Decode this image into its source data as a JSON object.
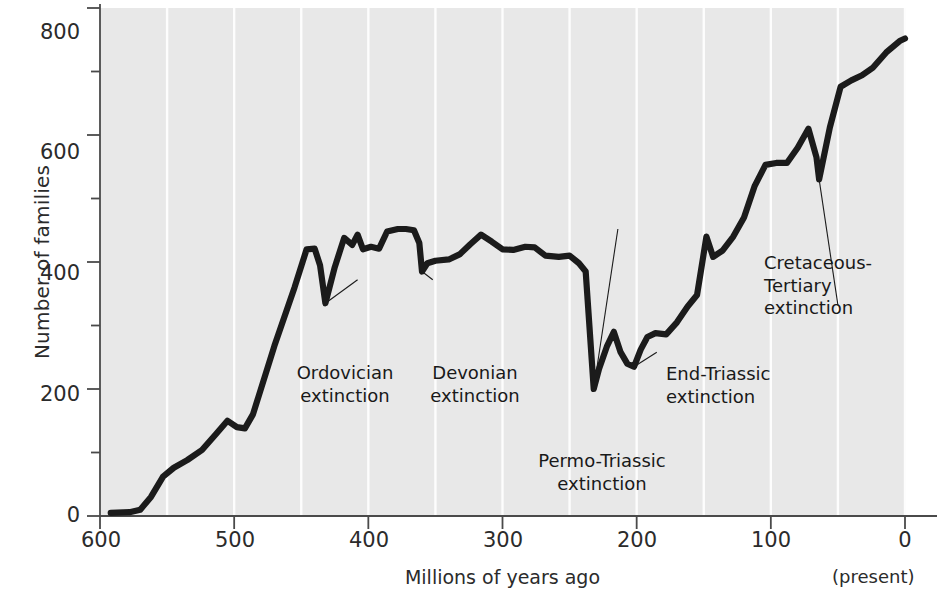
{
  "chart_data": {
    "type": "line",
    "title": "",
    "xlabel": "Millions of years ago",
    "ylabel": "Number of families",
    "xlim": [
      600,
      0
    ],
    "ylim": [
      0,
      800
    ],
    "x_ticks": [
      600,
      500,
      400,
      300,
      200,
      100,
      0
    ],
    "x_minor_interval": 50,
    "y_ticks": [
      0,
      200,
      400,
      600,
      800
    ],
    "y_minor_interval": 100,
    "x_axis_reversed": true,
    "grid": "vertical white gridlines every 50 Myr",
    "legend": "none",
    "x_axis_note": "(present)",
    "series": [
      {
        "name": "Number of marine animal families",
        "points": [
          [
            592,
            5
          ],
          [
            578,
            6
          ],
          [
            570,
            10
          ],
          [
            562,
            30
          ],
          [
            553,
            62
          ],
          [
            545,
            76
          ],
          [
            535,
            88
          ],
          [
            524,
            104
          ],
          [
            514,
            128
          ],
          [
            505,
            150
          ],
          [
            498,
            140
          ],
          [
            492,
            138
          ],
          [
            486,
            160
          ],
          [
            470,
            268
          ],
          [
            455,
            360
          ],
          [
            446,
            420
          ],
          [
            440,
            421
          ],
          [
            436,
            395
          ],
          [
            432,
            335
          ],
          [
            425,
            392
          ],
          [
            418,
            438
          ],
          [
            412,
            427
          ],
          [
            408,
            443
          ],
          [
            404,
            420
          ],
          [
            398,
            424
          ],
          [
            392,
            421
          ],
          [
            386,
            448
          ],
          [
            378,
            452
          ],
          [
            372,
            452
          ],
          [
            366,
            450
          ],
          [
            362,
            430
          ],
          [
            360,
            385
          ],
          [
            356,
            398
          ],
          [
            350,
            402
          ],
          [
            340,
            404
          ],
          [
            332,
            412
          ],
          [
            324,
            428
          ],
          [
            316,
            443
          ],
          [
            308,
            432
          ],
          [
            300,
            420
          ],
          [
            292,
            419
          ],
          [
            283,
            424
          ],
          [
            276,
            423
          ],
          [
            268,
            410
          ],
          [
            258,
            408
          ],
          [
            250,
            410
          ],
          [
            243,
            398
          ],
          [
            238,
            385
          ],
          [
            232,
            200
          ],
          [
            228,
            232
          ],
          [
            222,
            268
          ],
          [
            217,
            290
          ],
          [
            212,
            258
          ],
          [
            207,
            240
          ],
          [
            202,
            235
          ],
          [
            197,
            262
          ],
          [
            192,
            282
          ],
          [
            186,
            288
          ],
          [
            178,
            286
          ],
          [
            170,
            305
          ],
          [
            162,
            330
          ],
          [
            155,
            348
          ],
          [
            148,
            440
          ],
          [
            143,
            408
          ],
          [
            136,
            418
          ],
          [
            128,
            440
          ],
          [
            120,
            470
          ],
          [
            112,
            520
          ],
          [
            104,
            553
          ],
          [
            96,
            556
          ],
          [
            88,
            556
          ],
          [
            80,
            580
          ],
          [
            72,
            610
          ],
          [
            66,
            565
          ],
          [
            64,
            530
          ],
          [
            56,
            612
          ],
          [
            48,
            676
          ],
          [
            40,
            686
          ],
          [
            32,
            694
          ],
          [
            24,
            706
          ],
          [
            14,
            730
          ],
          [
            4,
            748
          ],
          [
            0,
            752
          ]
        ]
      }
    ],
    "annotations": [
      {
        "id": "ordovician",
        "text": "Ordovician\nextinction",
        "at_x": 432,
        "at_y": 335
      },
      {
        "id": "devonian",
        "text": "Devonian\nextinction",
        "at_x": 360,
        "at_y": 385
      },
      {
        "id": "permo",
        "text": "Permo-Triassic\nextinction",
        "at_x": 232,
        "at_y": 200
      },
      {
        "id": "endtriassic",
        "text": "End-Triassic\nextinction",
        "at_x": 202,
        "at_y": 235
      },
      {
        "id": "kt",
        "text": "Cretaceous-\nTertiary\nextinction",
        "at_x": 64,
        "at_y": 530
      }
    ]
  },
  "axes": {
    "y_label": "Number of families",
    "x_label": "Millions of years ago",
    "x_note": "(present)",
    "y_tick_labels": [
      "800",
      "600",
      "400",
      "200",
      "0"
    ],
    "x_tick_labels": [
      "600",
      "500",
      "400",
      "300",
      "200",
      "100",
      "0"
    ]
  },
  "annotations": {
    "ordovician": "Ordovician\nextinction",
    "devonian": "Devonian\nextinction",
    "permo_triassic": "Permo-Triassic\nextinction",
    "end_triassic": "End-Triassic\nextinction",
    "cretaceous_tertiary": "Cretaceous-\nTertiary\nextinction"
  },
  "style": {
    "panel_color": "#e8e8e8",
    "gridline_color": "#fdfdfd",
    "curve_color": "#1b1b1b",
    "axis_color": "#4a4a4a",
    "text_color": "#2b2b2b"
  }
}
